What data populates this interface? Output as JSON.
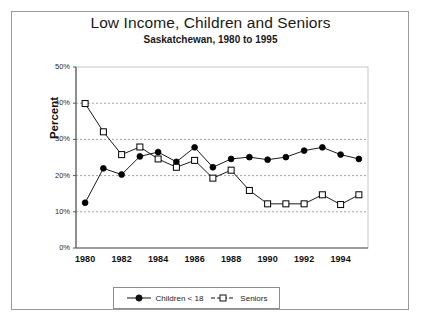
{
  "chart_data": {
    "type": "line",
    "title": "Low Income, Children and Seniors",
    "subtitle": "Saskatchewan, 1980 to 1995",
    "xlabel": "",
    "ylabel": "Percent",
    "x": [
      1980,
      1981,
      1982,
      1983,
      1984,
      1985,
      1986,
      1987,
      1988,
      1989,
      1990,
      1991,
      1992,
      1993,
      1994,
      1995
    ],
    "xtick_labels": [
      "1980",
      "1982",
      "1984",
      "1986",
      "1988",
      "1990",
      "1992",
      "1994"
    ],
    "xtick_values": [
      1980,
      1982,
      1984,
      1986,
      1988,
      1990,
      1992,
      1994
    ],
    "xlim": [
      1979.5,
      1995.5
    ],
    "ylim": [
      0,
      50
    ],
    "ytick_labels": [
      "0%",
      "10%",
      "20%",
      "30%",
      "40%",
      "50%"
    ],
    "ytick_values": [
      0,
      10,
      20,
      30,
      40,
      50
    ],
    "grid": true,
    "grid_style": "dashed-horizontal",
    "legend_position": "bottom-center",
    "series": [
      {
        "name": "Children < 18",
        "marker": "filled-circle",
        "color": "#000000",
        "values": [
          12.5,
          22.0,
          20.3,
          25.3,
          26.5,
          23.8,
          27.8,
          22.3,
          24.6,
          25.1,
          24.4,
          25.1,
          26.9,
          27.8,
          25.8,
          24.6
        ]
      },
      {
        "name": "Seniors",
        "marker": "open-square",
        "color": "#000000",
        "values": [
          39.9,
          32.1,
          25.8,
          27.9,
          24.6,
          22.3,
          24.2,
          19.3,
          21.5,
          15.9,
          12.2,
          12.2,
          12.2,
          14.7,
          12.0,
          14.7
        ]
      }
    ]
  },
  "legend": {
    "items": [
      {
        "label": "Children < 18",
        "marker": "filled-circle"
      },
      {
        "label": "Seniors",
        "marker": "open-square"
      }
    ]
  },
  "colors": {
    "frame": "#9a9a9a",
    "axis": "#555555",
    "grid": "#8a8a8a",
    "series": "#000000",
    "background": "#ffffff"
  }
}
